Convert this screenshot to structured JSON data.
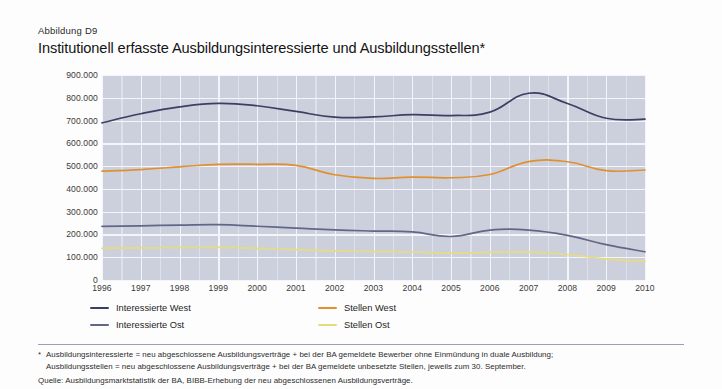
{
  "figure": {
    "number": "Abbildung D9",
    "title": "Institutionell erfasste Ausbildungsinteressierte und Ausbildungsstellen*"
  },
  "footnotes": {
    "star_marker": "*",
    "star_line1": "Ausbildungsinteressierte = neu abgeschlossene Ausbildungsverträge + bei der BA gemeldete Bewerber ohne Einmündung in duale Ausbildung;",
    "star_line2": "Ausbildungsstellen = neu abgeschlossene Ausbildungsverträge + bei der BA gemeldete unbesetzte Stellen, jeweils zum 30. September.",
    "source": "Quelle: Ausbildungsmarktstatistik der BA, BIBB-Erhebung der neu abgeschlossenen Ausbildungsverträge."
  },
  "legend": {
    "position": "below-axis",
    "items": [
      {
        "label": "Interessierte West",
        "color": "#3b3f63"
      },
      {
        "label": "Stellen West",
        "color": "#e0902f"
      },
      {
        "label": "Interessierte Ost",
        "color": "#626688"
      },
      {
        "label": "Stellen Ost",
        "color": "#e7dc7c"
      }
    ]
  },
  "chart_data": {
    "type": "line",
    "title": "Institutionell erfasste Ausbildungsinteressierte und Ausbildungsstellen*",
    "xlabel": "",
    "ylabel": "",
    "grid": true,
    "legend_position": "bottom",
    "x": [
      1996,
      1997,
      1998,
      1999,
      2000,
      2001,
      2002,
      2003,
      2004,
      2005,
      2006,
      2007,
      2008,
      2009,
      2010
    ],
    "categories": [
      "1996",
      "1997",
      "1998",
      "1999",
      "2000",
      "2001",
      "2002",
      "2003",
      "2004",
      "2005",
      "2006",
      "2007",
      "2008",
      "2009",
      "2010"
    ],
    "ytick_labels": [
      "0",
      "100.000",
      "200.000",
      "300.000",
      "400.000",
      "500.000",
      "600.000",
      "700.000",
      "800.000",
      "900.000"
    ],
    "yticks": [
      0,
      100000,
      200000,
      300000,
      400000,
      500000,
      600000,
      700000,
      800000,
      900000
    ],
    "ylim": [
      0,
      900000
    ],
    "xlim": [
      1996,
      2010
    ],
    "series": [
      {
        "name": "Interessierte West",
        "color": "#3b3f63",
        "values": [
          690000,
          730000,
          760000,
          775000,
          765000,
          740000,
          715000,
          716000,
          726000,
          722000,
          737000,
          820000,
          775000,
          710000,
          706000
        ]
      },
      {
        "name": "Stellen West",
        "color": "#e0902f",
        "values": [
          478000,
          485000,
          497000,
          508000,
          508000,
          503000,
          462000,
          446000,
          452000,
          449000,
          463000,
          520000,
          519000,
          480000,
          483000
        ]
      },
      {
        "name": "Interessierte Ost",
        "color": "#626688",
        "values": [
          235000,
          238000,
          241000,
          243000,
          236000,
          228000,
          220000,
          215000,
          211000,
          191000,
          219000,
          219000,
          196000,
          155000,
          124000
        ]
      },
      {
        "name": "Stellen Ost",
        "color": "#e7dc7c",
        "values": [
          139000,
          141000,
          142000,
          143000,
          139000,
          133000,
          128000,
          125000,
          123000,
          118000,
          121000,
          122000,
          112000,
          92000,
          82000
        ]
      }
    ]
  }
}
